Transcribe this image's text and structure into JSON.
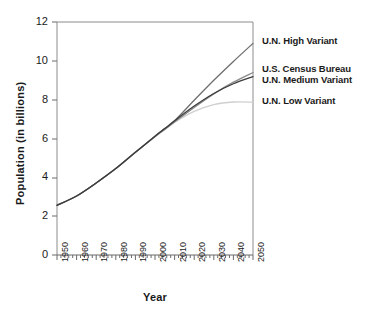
{
  "chart_data": {
    "type": "line",
    "title": "",
    "xlabel": "Year",
    "ylabel": "Population (in billions)",
    "xlim": [
      1950,
      2050
    ],
    "ylim": [
      0,
      12
    ],
    "xticks": [
      "1950",
      "1960",
      "1970",
      "1980",
      "1990",
      "2000",
      "2010",
      "2020",
      "2030",
      "2040",
      "2050"
    ],
    "yticks": [
      "0",
      "2",
      "4",
      "6",
      "8",
      "10",
      "12"
    ],
    "grid": false,
    "legend_position": "right-inline-annotations",
    "x": [
      1950,
      1960,
      1970,
      1980,
      1990,
      2000,
      2005,
      2010,
      2020,
      2030,
      2040,
      2050
    ],
    "series": [
      {
        "name": "U.N. High Variant",
        "color": "#6e6e6e",
        "values": [
          2.56,
          3.04,
          3.71,
          4.45,
          5.29,
          6.12,
          6.51,
          6.91,
          7.97,
          9.0,
          9.97,
          10.9
        ]
      },
      {
        "name": "U.S. Census Bureau",
        "color": "#8a8a8a",
        "values": [
          2.56,
          3.04,
          3.71,
          4.45,
          5.29,
          6.09,
          6.47,
          6.85,
          7.6,
          8.3,
          8.9,
          9.4
        ]
      },
      {
        "name": "U.N. Medium Variant",
        "color": "#3c3c3c",
        "values": [
          2.56,
          3.04,
          3.71,
          4.45,
          5.29,
          6.12,
          6.51,
          6.91,
          7.67,
          8.32,
          8.82,
          9.19
        ]
      },
      {
        "name": "U.N. Low Variant",
        "color": "#cfcfcf",
        "values": [
          2.56,
          3.04,
          3.71,
          4.45,
          5.29,
          6.12,
          6.48,
          6.84,
          7.4,
          7.75,
          7.88,
          7.87
        ]
      }
    ]
  },
  "axes": {
    "ylabel": "Population (in billions)",
    "xlabel": "Year",
    "yticks": [
      "12",
      "10",
      "8",
      "6",
      "4",
      "2",
      "0"
    ],
    "xticks": [
      "1950",
      "1960",
      "1970",
      "1980",
      "1990",
      "2000",
      "2010",
      "2020",
      "2030",
      "2040",
      "2050"
    ]
  },
  "annotations": [
    {
      "label": "U.N. High Variant",
      "top": 35
    },
    {
      "label": "U.S. Census Bureau",
      "top": 63
    },
    {
      "label": "U.N. Medium Variant",
      "top": 74
    },
    {
      "label": "U.N. Low Variant",
      "top": 95
    }
  ]
}
